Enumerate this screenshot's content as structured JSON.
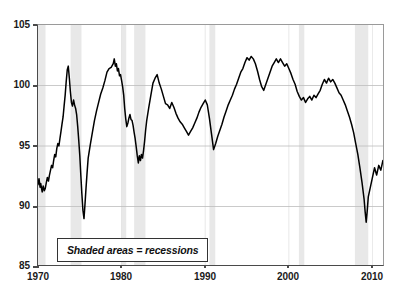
{
  "chart_data": {
    "type": "line",
    "title": "",
    "subtitle": "",
    "xlabel": "",
    "ylabel": "",
    "xlim": [
      1970,
      2011.5
    ],
    "ylim": [
      85,
      105
    ],
    "grid": true,
    "legend_position": "inside-bottom-left",
    "annotation": "Shaded areas = recessions",
    "y_ticks": [
      85,
      90,
      95,
      100,
      105
    ],
    "x_ticks": [
      1970,
      1980,
      1990,
      2000,
      2010
    ],
    "line_color": "#000000",
    "shading_color": "#e8e8e8",
    "series": [
      {
        "name": "Index",
        "x": [
          1970.0,
          1970.12,
          1970.25,
          1970.33,
          1970.42,
          1970.5,
          1970.62,
          1970.75,
          1970.87,
          1971.0,
          1971.12,
          1971.25,
          1971.37,
          1971.5,
          1971.62,
          1971.75,
          1971.87,
          1972.0,
          1972.12,
          1972.25,
          1972.37,
          1972.5,
          1972.62,
          1972.75,
          1972.87,
          1973.0,
          1973.12,
          1973.25,
          1973.37,
          1973.5,
          1973.62,
          1973.75,
          1973.87,
          1974.0,
          1974.12,
          1974.25,
          1974.37,
          1974.5,
          1974.62,
          1974.75,
          1974.87,
          1975.0,
          1975.12,
          1975.25,
          1975.37,
          1975.5,
          1975.62,
          1975.75,
          1975.87,
          1976.0,
          1976.25,
          1976.5,
          1976.75,
          1977.0,
          1977.25,
          1977.5,
          1977.75,
          1978.0,
          1978.25,
          1978.5,
          1978.75,
          1979.0,
          1979.12,
          1979.25,
          1979.37,
          1979.5,
          1979.62,
          1979.75,
          1979.87,
          1980.0,
          1980.12,
          1980.25,
          1980.37,
          1980.5,
          1980.62,
          1980.75,
          1980.87,
          1981.0,
          1981.12,
          1981.25,
          1981.37,
          1981.5,
          1981.62,
          1981.75,
          1981.87,
          1982.0,
          1982.12,
          1982.25,
          1982.37,
          1982.5,
          1982.62,
          1982.75,
          1982.87,
          1983.0,
          1983.25,
          1983.5,
          1983.75,
          1984.0,
          1984.25,
          1984.5,
          1984.75,
          1985.0,
          1985.25,
          1985.5,
          1985.75,
          1986.0,
          1986.25,
          1986.5,
          1986.75,
          1987.0,
          1987.25,
          1987.5,
          1987.75,
          1988.0,
          1988.25,
          1988.5,
          1988.75,
          1989.0,
          1989.25,
          1989.5,
          1989.75,
          1990.0,
          1990.25,
          1990.5,
          1990.75,
          1991.0,
          1991.25,
          1991.5,
          1991.75,
          1992.0,
          1992.25,
          1992.5,
          1992.75,
          1993.0,
          1993.25,
          1993.5,
          1993.75,
          1994.0,
          1994.25,
          1994.5,
          1994.75,
          1995.0,
          1995.25,
          1995.5,
          1995.75,
          1996.0,
          1996.25,
          1996.5,
          1996.75,
          1997.0,
          1997.25,
          1997.5,
          1997.75,
          1998.0,
          1998.25,
          1998.5,
          1998.75,
          1999.0,
          1999.25,
          1999.5,
          1999.75,
          2000.0,
          2000.25,
          2000.5,
          2000.75,
          2001.0,
          2001.25,
          2001.5,
          2001.75,
          2002.0,
          2002.25,
          2002.5,
          2002.75,
          2003.0,
          2003.25,
          2003.5,
          2003.75,
          2004.0,
          2004.25,
          2004.5,
          2004.75,
          2005.0,
          2005.25,
          2005.5,
          2005.75,
          2006.0,
          2006.25,
          2006.5,
          2006.75,
          2007.0,
          2007.25,
          2007.5,
          2007.75,
          2008.0,
          2008.25,
          2008.5,
          2008.75,
          2009.0,
          2009.12,
          2009.25,
          2009.37,
          2009.5,
          2009.75,
          2010.0,
          2010.25,
          2010.5,
          2010.75,
          2011.0,
          2011.25,
          2011.4
        ],
        "values": [
          91.8,
          92.3,
          91.6,
          91.9,
          91.5,
          91.2,
          91.7,
          91.3,
          91.5,
          92.0,
          92.4,
          92.1,
          92.6,
          93.0,
          93.4,
          93.2,
          93.8,
          94.3,
          94.1,
          94.8,
          95.2,
          95.0,
          95.6,
          96.2,
          96.8,
          97.4,
          98.3,
          99.2,
          100.3,
          101.3,
          101.6,
          100.6,
          99.5,
          98.6,
          98.3,
          98.8,
          98.4,
          98.1,
          97.6,
          96.6,
          95.5,
          94.2,
          92.6,
          91.0,
          89.7,
          89.0,
          90.2,
          91.6,
          92.8,
          94.0,
          95.1,
          96.1,
          97.1,
          97.9,
          98.6,
          99.3,
          99.8,
          100.4,
          101.1,
          101.4,
          101.5,
          101.8,
          102.2,
          101.6,
          101.8,
          101.2,
          101.4,
          100.8,
          100.9,
          100.4,
          99.9,
          99.2,
          98.1,
          97.2,
          96.6,
          96.9,
          97.3,
          97.6,
          97.2,
          97.1,
          96.7,
          96.1,
          95.6,
          94.9,
          94.2,
          93.6,
          94.2,
          93.8,
          94.3,
          94.0,
          94.6,
          95.4,
          96.3,
          97.1,
          98.2,
          99.2,
          100.2,
          100.6,
          100.9,
          100.2,
          99.7,
          99.1,
          98.5,
          98.4,
          98.1,
          98.6,
          98.2,
          97.7,
          97.3,
          97.0,
          96.8,
          96.5,
          96.2,
          95.9,
          96.2,
          96.5,
          96.9,
          97.3,
          97.8,
          98.2,
          98.5,
          98.8,
          98.4,
          97.3,
          96.0,
          94.7,
          95.2,
          95.8,
          96.3,
          96.8,
          97.4,
          97.9,
          98.4,
          98.8,
          99.2,
          99.7,
          100.1,
          100.6,
          101.1,
          101.4,
          101.9,
          102.3,
          102.1,
          102.4,
          102.2,
          101.8,
          101.2,
          100.5,
          99.9,
          99.6,
          100.1,
          100.6,
          101.1,
          101.6,
          101.9,
          102.2,
          101.9,
          102.2,
          101.9,
          101.6,
          101.8,
          101.4,
          101.0,
          100.5,
          100.1,
          99.5,
          99.1,
          98.8,
          99.0,
          98.6,
          98.9,
          99.1,
          98.8,
          99.2,
          99.0,
          99.3,
          99.6,
          100.1,
          100.5,
          100.2,
          100.6,
          100.3,
          100.5,
          100.2,
          99.8,
          99.4,
          99.2,
          98.8,
          98.4,
          97.9,
          97.4,
          96.8,
          96.1,
          95.2,
          94.3,
          93.2,
          92.0,
          90.6,
          89.6,
          88.7,
          89.6,
          90.8,
          91.6,
          92.4,
          93.2,
          92.6,
          93.4,
          93.0,
          93.8,
          93.4
        ]
      }
    ],
    "recessions": [
      {
        "label": "1969-1970",
        "start": 1969.9,
        "end": 1970.9
      },
      {
        "label": "1973-1975",
        "start": 1973.9,
        "end": 1975.2
      },
      {
        "label": "1980",
        "start": 1980.0,
        "end": 1980.55
      },
      {
        "label": "1981-1982",
        "start": 1981.5,
        "end": 1982.85
      },
      {
        "label": "1990-1991",
        "start": 1990.5,
        "end": 1991.2
      },
      {
        "label": "2001",
        "start": 2001.2,
        "end": 2001.85
      },
      {
        "label": "2007-2009",
        "start": 2007.9,
        "end": 2009.5
      }
    ]
  },
  "axes": {
    "y_ticks": [
      {
        "label": "105",
        "value": 105
      },
      {
        "label": "100",
        "value": 100
      },
      {
        "label": "95",
        "value": 95
      },
      {
        "label": "90",
        "value": 90
      },
      {
        "label": "85",
        "value": 85
      }
    ],
    "x_ticks": [
      {
        "label": "1970",
        "value": 1970
      },
      {
        "label": "1980",
        "value": 1980
      },
      {
        "label": "1990",
        "value": 1990
      },
      {
        "label": "2000",
        "value": 2000
      },
      {
        "label": "2010",
        "value": 2010
      }
    ]
  },
  "annotation": {
    "text": "Shaded areas = recessions"
  },
  "colors": {
    "line": "#000000",
    "shading": "#e8e8e8",
    "grid": "#bdbdbd",
    "axis": "#4a4a4a"
  }
}
